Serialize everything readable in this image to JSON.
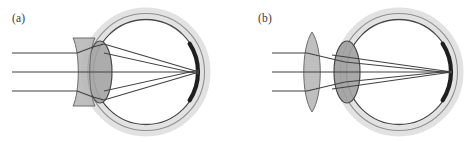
{
  "figure": {
    "width": 469,
    "height": 142,
    "background_color": "#ffffff"
  },
  "colors": {
    "outline_dark": "#3c3c3c",
    "outline_mid": "#6e6e6e",
    "sclera_band": "#e4e4e4",
    "lens_fill": "#a8a8a8",
    "corrective_lens_fill": "#b4b4b4",
    "retina_dark": "#1a1a1a",
    "ray_stroke": "#444444",
    "label_text": "#3a3a3a"
  },
  "panels": [
    {
      "id": "panel-a",
      "label": "(a)",
      "label_x": 12,
      "label_y": 22,
      "condition": "myopia-corrected-with-diverging-lens",
      "corrective_lens": {
        "type": "biconcave",
        "center_x": 84,
        "center_y": 72,
        "half_height": 34,
        "half_width": 11
      },
      "eye": {
        "center_x": 146,
        "center_y": 72,
        "radius_outer": 59,
        "radius_inner": 53,
        "crystalline_lens": {
          "center_x": 100,
          "center_y": 72,
          "rx": 12,
          "ry": 31
        },
        "retina_arc": {
          "start_angle_deg": -33,
          "end_angle_deg": 33,
          "radius": 52
        },
        "focus_x": 199,
        "focus_y": 72
      },
      "rays": {
        "count": 3,
        "start_x": 12,
        "y_values": [
          53,
          72,
          91
        ]
      }
    },
    {
      "id": "panel-b",
      "label": "(b)",
      "label_x": 258,
      "label_y": 22,
      "condition": "hyperopia-corrected-with-converging-lens",
      "corrective_lens": {
        "type": "biconvex",
        "center_x": 312,
        "center_y": 72,
        "half_height": 40,
        "half_width": 11
      },
      "eye": {
        "center_x": 399,
        "center_y": 72,
        "radius_outer": 59,
        "radius_inner": 53,
        "crystalline_lens": {
          "center_x": 347,
          "center_y": 72,
          "rx": 13,
          "ry": 31
        },
        "retina_arc": {
          "start_angle_deg": -33,
          "end_angle_deg": 33,
          "radius": 52
        },
        "focus_x": 452,
        "focus_y": 72
      },
      "rays": {
        "count": 3,
        "start_x": 272,
        "y_values": [
          53,
          72,
          91
        ]
      }
    }
  ]
}
